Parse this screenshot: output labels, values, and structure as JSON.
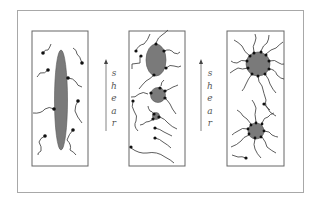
{
  "figure": {
    "panels": [
      {
        "id": "panel-1",
        "label": "elongated-micelle"
      },
      {
        "id": "panel-2",
        "label": "fragmenting-micelles"
      },
      {
        "id": "panel-3",
        "label": "spherical-star-micelles"
      }
    ],
    "arrows": [
      {
        "id": "arrow-1",
        "direction": "up",
        "label": "shear",
        "letters": [
          "s",
          "h",
          "e",
          "a",
          "r"
        ]
      },
      {
        "id": "arrow-2",
        "direction": "up",
        "label": "shear",
        "letters": [
          "s",
          "h",
          "e",
          "a",
          "r"
        ]
      }
    ],
    "colors": {
      "micelle_core": "#7a7a7a",
      "chain": "#333333",
      "head": "#111111",
      "frame": "#a8a8a8",
      "panel_border": "#555555"
    }
  }
}
